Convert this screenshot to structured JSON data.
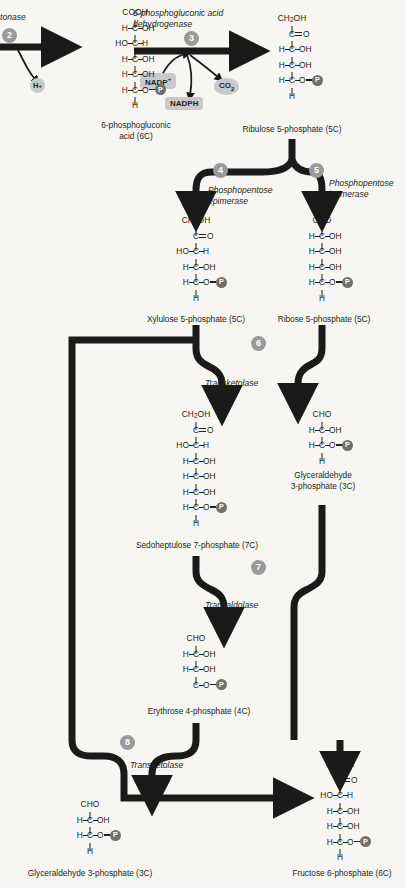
{
  "diagram": {
    "colors": {
      "background": "#f7f6f3",
      "ink": "#231f20",
      "step_badge": "#9a9a9a",
      "phosphate_disc": "#6f6f6f",
      "cofactor_pill": "#c9c9c9"
    }
  },
  "steps": [
    {
      "id": "step-2",
      "number": "2",
      "enzyme": "tonase"
    },
    {
      "id": "step-3",
      "number": "3",
      "enzyme": "6-phosphogluconic acid dehydrogenase"
    },
    {
      "id": "step-4",
      "number": "4",
      "enzyme": "Phosphopentose epimerase"
    },
    {
      "id": "step-5",
      "number": "5",
      "enzyme": "Phosphopentose isomerase"
    },
    {
      "id": "step-6",
      "number": "6",
      "enzyme": "Transketolase"
    },
    {
      "id": "step-7",
      "number": "7",
      "enzyme": "Transaldolase"
    },
    {
      "id": "step-8",
      "number": "8",
      "enzyme": "Transketolase"
    }
  ],
  "enzyme_labels": {
    "lactonase_partial": "tonase",
    "dehydrogenase_line1": "6-phosphogluconic acid",
    "dehydrogenase_line2": "dehydrogenase",
    "epimerase_line1": "Phosphopentose",
    "epimerase_line2": "epimerase",
    "isomerase_line1": "Phosphopentose",
    "isomerase_line2": "isomerase",
    "transketolase_6": "Transketolase",
    "transaldolase_7": "Transaldolase",
    "transketolase_8": "Transketolase"
  },
  "cofactors": [
    {
      "id": "h-plus",
      "label": "H",
      "sup": "+",
      "shape": "circle"
    },
    {
      "id": "nadp-plus",
      "label": "NADP",
      "sup": "+",
      "shape": "pill"
    },
    {
      "id": "nadph",
      "label": "NADPH",
      "sup": "",
      "shape": "pill"
    },
    {
      "id": "co2",
      "label": "CO",
      "sub": "2",
      "shape": "oval"
    }
  ],
  "metabolites": [
    {
      "id": "6-phosphogluconic-acid",
      "name_line1": "6-phosphogluconic",
      "name_line2": "acid (6C)",
      "rows": [
        "COOH",
        "H-C-OH",
        "HO-C-H",
        "H-C-OH",
        "H-C-OH",
        "H-C-O-P",
        "H"
      ]
    },
    {
      "id": "ribulose-5-phosphate",
      "name_line1": "Ribulose 5-phosphate (5C)",
      "name_line2": "",
      "rows": [
        "CH2OH",
        "C=O",
        "H-C-OH",
        "H-C-OH",
        "H-C-O-P",
        "H"
      ]
    },
    {
      "id": "xylulose-5-phosphate",
      "name_line1": "Xylulose 5-phosphate (5C)",
      "name_line2": "",
      "rows": [
        "CH2OH",
        "C=O",
        "HO-C-H",
        "H-C-OH",
        "H-C-O-P",
        "H"
      ]
    },
    {
      "id": "ribose-5-phosphate",
      "name_line1": "Ribose 5-phosphate (5C)",
      "name_line2": "",
      "rows": [
        "CHO",
        "H-C-OH",
        "H-C-OH",
        "H-C-OH",
        "H-C-O-P",
        "H"
      ]
    },
    {
      "id": "sedoheptulose-7-phosphate",
      "name_line1": "Sedoheptulose 7-phosphate (7C)",
      "name_line2": "",
      "rows": [
        "CH2OH",
        "C=O",
        "HO-C-H",
        "H-C-OH",
        "H-C-OH",
        "H-C-OH",
        "H-C-O-P",
        "H"
      ]
    },
    {
      "id": "glyceraldehyde-3-phosphate-mid",
      "name_line1": "Glyceraldehyde",
      "name_line2": "3-phosphate (3C)",
      "rows": [
        "CHO",
        "H-C-OH",
        "H-C-O-P",
        "H"
      ]
    },
    {
      "id": "erythrose-4-phosphate",
      "name_line1": "Erythrose 4-phosphate (4C)",
      "name_line2": "",
      "rows": [
        "CHO",
        "H-C-OH",
        "H-C-OH",
        "C-O-P"
      ]
    },
    {
      "id": "glyceraldehyde-3-phosphate-bottom",
      "name_line1": "Glyceraldehyde 3-phosphate (3C)",
      "name_line2": "",
      "rows": [
        "CHO",
        "H-C-OH",
        "H-C-O-P",
        "H"
      ]
    },
    {
      "id": "fructose-6-phosphate",
      "name_line1": "Fructose 6-phosphate (6C)",
      "name_line2": "",
      "rows": [
        "CH2OH",
        "C=O",
        "HO-C-H",
        "H-C-OH",
        "H-C-OH",
        "H-C-O-P",
        "H"
      ]
    }
  ],
  "atoms": {
    "COOH": "COOH",
    "CHO": "CHO",
    "CH2": "CH",
    "CH2sub": "2",
    "OH": "OH",
    "HO": "HO",
    "H": "H",
    "C": "C",
    "O": "O",
    "P": "P"
  }
}
